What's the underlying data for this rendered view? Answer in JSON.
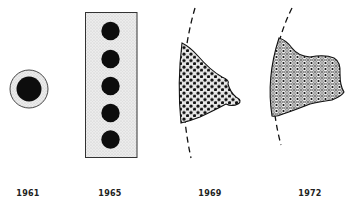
{
  "figure": {
    "stages": [
      {
        "id": "1961",
        "year": "1961",
        "label_x": 28,
        "shape": "single-cell-circle"
      },
      {
        "id": "1965",
        "year": "1965",
        "label_x": 110,
        "shape": "rectangle-with-five-nuclei"
      },
      {
        "id": "1969",
        "year": "1969",
        "label_x": 210,
        "shape": "tissue-fragment-dotted"
      },
      {
        "id": "1972",
        "year": "1972",
        "label_x": 310,
        "shape": "tissue-fragment-cellular"
      }
    ],
    "colors": {
      "ink": "#111111",
      "stipple_fill": "#e6e6e6",
      "background": "#ffffff"
    }
  }
}
